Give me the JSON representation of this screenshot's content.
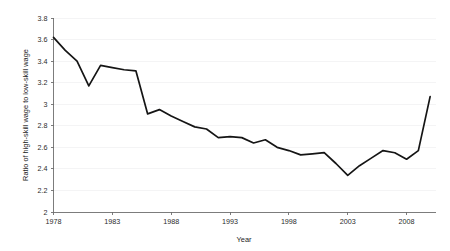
{
  "chart_data": {
    "type": "line",
    "title": "",
    "xlabel": "Year",
    "ylabel": "Ratio of high-skill wage to low-skill wage",
    "xlim": [
      1978,
      2010.5
    ],
    "ylim": [
      2,
      3.8
    ],
    "grid": true,
    "legend": null,
    "line_color": "#151515",
    "background_color": "#ffffff",
    "grid_color": "#f1f1f3",
    "axis_color": "#6e6e6e",
    "xticks": [
      1978,
      1983,
      1988,
      1993,
      1998,
      2003,
      2008
    ],
    "xtick_labels": [
      "1978",
      "1983",
      "1988",
      "1993",
      "1998",
      "2003",
      "2008"
    ],
    "yticks": [
      2,
      2.2,
      2.4,
      2.6,
      2.8,
      3,
      3.2,
      3.4,
      3.6,
      3.8
    ],
    "ytick_labels": [
      "2",
      "2.2",
      "2.4",
      "2.6",
      "2.8",
      "3",
      "3.2",
      "3.4",
      "3.6",
      "3.8"
    ],
    "x": [
      1978,
      1979,
      1980,
      1981,
      1982,
      1983,
      1984,
      1985,
      1986,
      1987,
      1988,
      1989,
      1990,
      1991,
      1992,
      1993,
      1994,
      1995,
      1996,
      1997,
      1998,
      1999,
      2000,
      2001,
      2002,
      2003,
      2004,
      2005,
      2006,
      2007,
      2008,
      2009,
      2010
    ],
    "values": [
      3.62,
      3.5,
      3.4,
      3.17,
      3.36,
      3.34,
      3.32,
      3.31,
      2.91,
      2.95,
      2.89,
      2.84,
      2.79,
      2.77,
      2.69,
      2.7,
      2.69,
      2.64,
      2.67,
      2.6,
      2.57,
      2.53,
      2.54,
      2.55,
      2.45,
      2.34,
      2.43,
      2.5,
      2.57,
      2.55,
      2.49,
      2.57,
      3.07
    ],
    "series": [
      {
        "name": "Ratio of high-skill wage to low-skill wage",
        "values": [
          3.62,
          3.5,
          3.4,
          3.17,
          3.36,
          3.34,
          3.32,
          3.31,
          2.91,
          2.95,
          2.89,
          2.84,
          2.79,
          2.77,
          2.69,
          2.7,
          2.69,
          2.64,
          2.67,
          2.6,
          2.57,
          2.53,
          2.54,
          2.55,
          2.45,
          2.34,
          2.43,
          2.5,
          2.57,
          2.55,
          2.49,
          2.57,
          3.07
        ]
      }
    ]
  }
}
